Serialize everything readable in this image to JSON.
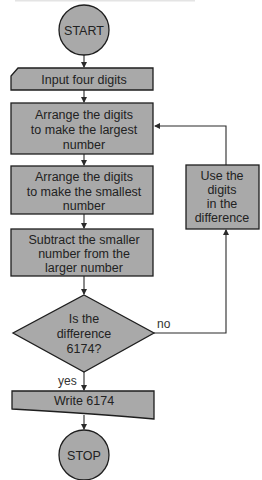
{
  "diagram": {
    "type": "flowchart",
    "nodes": {
      "start": {
        "kind": "terminator",
        "lines": [
          "START"
        ]
      },
      "input": {
        "kind": "input",
        "lines": [
          "Input four digits"
        ]
      },
      "largest": {
        "kind": "process",
        "lines": [
          "Arrange the digits",
          "to make the largest",
          "number"
        ]
      },
      "smallest": {
        "kind": "process",
        "lines": [
          "Arrange the digits",
          "to make the smallest",
          "number"
        ]
      },
      "subtract": {
        "kind": "process",
        "lines": [
          "Subtract the smaller",
          "number from the",
          "larger number"
        ]
      },
      "decision": {
        "kind": "decision",
        "lines": [
          "Is the",
          "difference",
          "6174?"
        ]
      },
      "use_digits": {
        "kind": "process",
        "lines": [
          "Use the",
          "digits",
          "in the",
          "difference"
        ]
      },
      "write": {
        "kind": "output",
        "lines": [
          "Write 6174"
        ]
      },
      "stop": {
        "kind": "terminator",
        "lines": [
          "STOP"
        ]
      }
    },
    "edges": [
      {
        "from": "start",
        "to": "input",
        "label": ""
      },
      {
        "from": "input",
        "to": "largest",
        "label": ""
      },
      {
        "from": "largest",
        "to": "smallest",
        "label": ""
      },
      {
        "from": "smallest",
        "to": "subtract",
        "label": ""
      },
      {
        "from": "subtract",
        "to": "decision",
        "label": ""
      },
      {
        "from": "decision",
        "to": "use_digits",
        "label": "no"
      },
      {
        "from": "use_digits",
        "to": "largest",
        "label": ""
      },
      {
        "from": "decision",
        "to": "write",
        "label": "yes"
      },
      {
        "from": "write",
        "to": "stop",
        "label": ""
      }
    ],
    "edge_labels": {
      "no": "no",
      "yes": "yes"
    },
    "colors": {
      "shape_fill": "#a9a9a9",
      "stroke": "#1e1e1e",
      "text": "#222222",
      "background": "#ffffff"
    }
  }
}
